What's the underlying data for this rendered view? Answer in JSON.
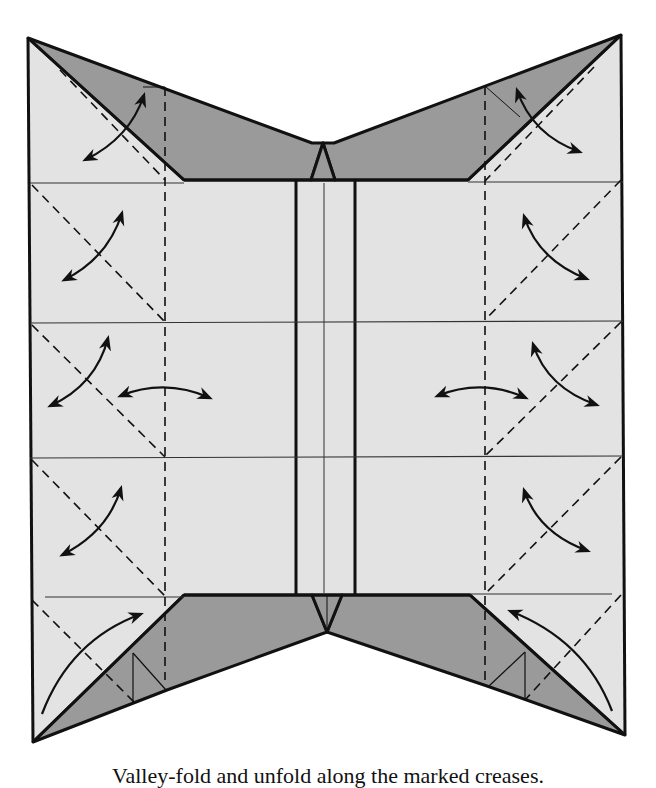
{
  "diagram": {
    "colors": {
      "paper_light": "#e3e3e3",
      "paper_dark": "#9a9a9a",
      "line": "#111111",
      "background": "#ffffff"
    },
    "elements": {
      "outline": "Sheet outline with center vertical strip",
      "horizontal_creases": 5,
      "vertical_valley_folds": 2,
      "diagonal_valley_folds": 8,
      "fold_unfold_arrows": 10,
      "fold_arrows": 2
    }
  },
  "caption": {
    "text": "Valley-fold and unfold along the marked creases."
  }
}
